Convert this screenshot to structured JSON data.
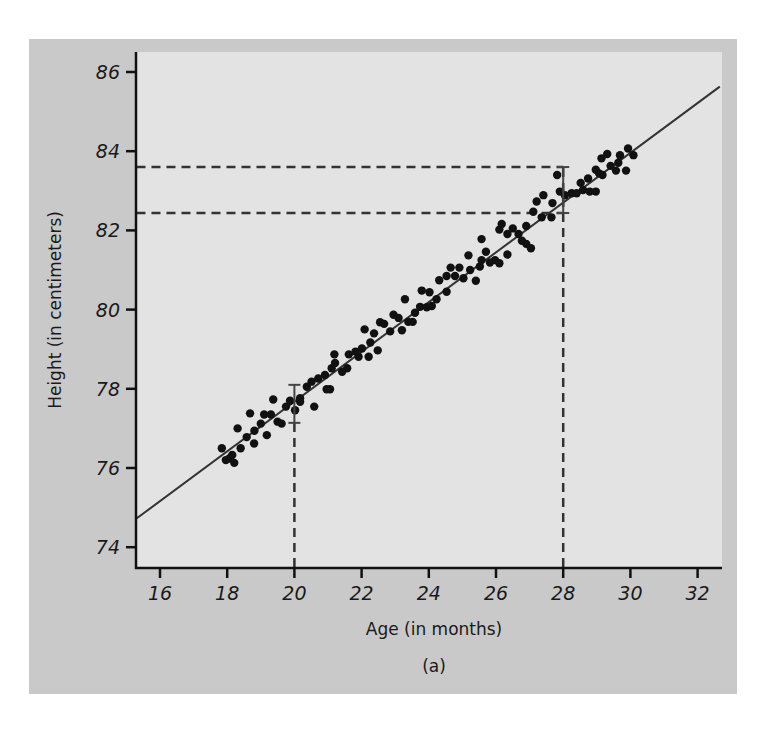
{
  "chart_data": {
    "type": "scatter",
    "title": "",
    "caption": "(a)",
    "xlabel": "Age (in months)",
    "ylabel": "Height (in centimeters)",
    "xlim": [
      15.3,
      32.7
    ],
    "ylim": [
      73.5,
      86.5
    ],
    "xticks": [
      16,
      18,
      20,
      22,
      24,
      26,
      28,
      30,
      32
    ],
    "yticks": [
      74,
      76,
      78,
      80,
      82,
      84,
      86
    ],
    "grid": false,
    "legend": null,
    "colors": {
      "panel": "#c9c9c9",
      "plot_area": "#e3e3e3",
      "points": "#111111",
      "line": "#333333",
      "dashed": "#333333"
    },
    "regression_line": {
      "x1": 15.31,
      "y1": 74.73,
      "x2": 32.66,
      "y2": 85.63,
      "slope": 0.628
    },
    "error_bars": [
      {
        "x": 20,
        "y_low": 77.14,
        "y_high": 78.1
      },
      {
        "x": 28,
        "y_low": 82.44,
        "y_high": 83.6
      }
    ],
    "reference_lines": [
      {
        "type": "vertical",
        "x": 20,
        "from_y": 73.5,
        "to_y": 77.14
      },
      {
        "type": "vertical",
        "x": 28,
        "from_y": 73.5,
        "to_y": 83.6
      },
      {
        "type": "horizontal",
        "y": 83.6,
        "from_x": 15.3,
        "to_x": 28
      },
      {
        "type": "horizontal",
        "y": 82.44,
        "from_x": 15.3,
        "to_x": 28
      }
    ],
    "points": [
      [
        17.84,
        76.5
      ],
      [
        17.96,
        76.2
      ],
      [
        18.06,
        76.24
      ],
      [
        18.15,
        76.33
      ],
      [
        18.21,
        76.13
      ],
      [
        18.31,
        77.0
      ],
      [
        18.4,
        76.5
      ],
      [
        18.58,
        76.78
      ],
      [
        18.68,
        77.38
      ],
      [
        18.8,
        76.62
      ],
      [
        18.81,
        76.94
      ],
      [
        19.0,
        77.12
      ],
      [
        19.1,
        77.35
      ],
      [
        19.18,
        76.83
      ],
      [
        19.3,
        77.35
      ],
      [
        19.37,
        77.73
      ],
      [
        19.5,
        77.17
      ],
      [
        19.62,
        77.12
      ],
      [
        19.75,
        77.55
      ],
      [
        19.87,
        77.7
      ],
      [
        20.02,
        77.46
      ],
      [
        20.17,
        77.67
      ],
      [
        20.17,
        77.76
      ],
      [
        20.37,
        78.05
      ],
      [
        20.51,
        78.18
      ],
      [
        20.59,
        77.55
      ],
      [
        20.71,
        78.26
      ],
      [
        20.91,
        78.35
      ],
      [
        20.96,
        77.99
      ],
      [
        21.06,
        77.99
      ],
      [
        21.11,
        78.52
      ],
      [
        21.19,
        78.87
      ],
      [
        21.21,
        78.65
      ],
      [
        21.42,
        78.43
      ],
      [
        21.57,
        78.52
      ],
      [
        21.62,
        78.87
      ],
      [
        21.82,
        78.94
      ],
      [
        21.91,
        78.81
      ],
      [
        22.01,
        79.02
      ],
      [
        22.09,
        79.5
      ],
      [
        22.21,
        78.81
      ],
      [
        22.26,
        79.17
      ],
      [
        22.37,
        79.4
      ],
      [
        22.48,
        78.97
      ],
      [
        22.55,
        79.68
      ],
      [
        22.67,
        79.64
      ],
      [
        22.85,
        79.45
      ],
      [
        22.95,
        79.87
      ],
      [
        23.1,
        79.79
      ],
      [
        23.2,
        79.48
      ],
      [
        23.29,
        80.26
      ],
      [
        23.39,
        79.69
      ],
      [
        23.52,
        79.69
      ],
      [
        23.59,
        79.92
      ],
      [
        23.74,
        80.07
      ],
      [
        23.79,
        80.48
      ],
      [
        23.94,
        80.06
      ],
      [
        24.02,
        80.44
      ],
      [
        24.09,
        80.09
      ],
      [
        24.23,
        80.26
      ],
      [
        24.31,
        80.74
      ],
      [
        24.53,
        80.45
      ],
      [
        24.53,
        80.85
      ],
      [
        24.65,
        81.06
      ],
      [
        24.78,
        80.85
      ],
      [
        24.91,
        81.06
      ],
      [
        25.03,
        80.79
      ],
      [
        25.18,
        81.37
      ],
      [
        25.23,
        81.0
      ],
      [
        25.4,
        80.73
      ],
      [
        25.52,
        81.09
      ],
      [
        25.57,
        81.25
      ],
      [
        25.57,
        81.78
      ],
      [
        25.7,
        81.46
      ],
      [
        25.82,
        81.19
      ],
      [
        25.97,
        81.25
      ],
      [
        26.1,
        81.17
      ],
      [
        26.1,
        82.02
      ],
      [
        26.17,
        82.16
      ],
      [
        26.34,
        81.39
      ],
      [
        26.34,
        81.91
      ],
      [
        26.5,
        82.05
      ],
      [
        26.67,
        81.91
      ],
      [
        26.77,
        81.74
      ],
      [
        26.9,
        82.11
      ],
      [
        26.9,
        81.66
      ],
      [
        27.04,
        81.55
      ],
      [
        27.11,
        82.47
      ],
      [
        27.21,
        82.73
      ],
      [
        27.36,
        82.33
      ],
      [
        27.41,
        82.89
      ],
      [
        27.65,
        82.33
      ],
      [
        27.68,
        82.69
      ],
      [
        27.82,
        83.4
      ],
      [
        27.9,
        82.98
      ],
      [
        28.05,
        82.89
      ],
      [
        28.25,
        82.94
      ],
      [
        28.4,
        82.94
      ],
      [
        28.52,
        83.2
      ],
      [
        28.59,
        83.02
      ],
      [
        28.74,
        83.31
      ],
      [
        28.79,
        82.98
      ],
      [
        28.97,
        82.98
      ],
      [
        28.97,
        83.53
      ],
      [
        29.07,
        83.44
      ],
      [
        29.14,
        83.82
      ],
      [
        29.17,
        83.4
      ],
      [
        29.31,
        83.93
      ],
      [
        29.41,
        83.63
      ],
      [
        29.57,
        83.51
      ],
      [
        29.64,
        83.71
      ],
      [
        29.69,
        83.9
      ],
      [
        29.87,
        83.51
      ],
      [
        29.93,
        84.07
      ],
      [
        30.09,
        83.9
      ]
    ]
  },
  "figure": {
    "xlabel": "Age (in months)",
    "ylabel": "Height (in centimeters)",
    "caption": "(a)"
  }
}
